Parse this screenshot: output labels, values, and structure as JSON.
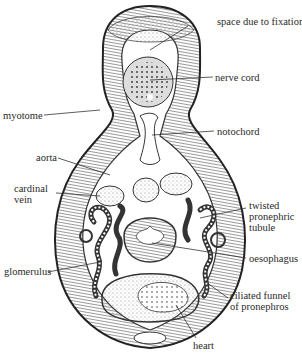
{
  "figure": {
    "labels": {
      "space_due_to_fixation": "space due to fixation",
      "nerve_cord": "nerve cord",
      "myotome": "myotome",
      "notochord": "notochord",
      "aorta": "aorta",
      "cardinal_vein_1": "cardinal",
      "cardinal_vein_2": "vein",
      "twisted_1": "twisted",
      "twisted_2": "pronephric",
      "twisted_3": "tubule",
      "oesophagus": "oesophagus",
      "glomerulus": "glomerulus",
      "ciliated_1": "ciliated funnel",
      "ciliated_2": "of pronephros",
      "heart": "heart"
    },
    "colors": {
      "ink": "#2a2a2a",
      "background": "#ffffff"
    }
  }
}
